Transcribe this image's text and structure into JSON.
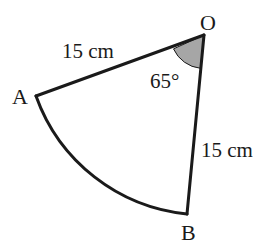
{
  "diagram": {
    "type": "circle-sector",
    "vertices": {
      "O": {
        "label": "O"
      },
      "A": {
        "label": "A"
      },
      "B": {
        "label": "B"
      }
    },
    "radius_OA_label": "15 cm",
    "radius_OB_label": "15 cm",
    "angle_label": "65°",
    "colors": {
      "stroke": "#1a1a1a",
      "angle_fill": "#a6a6a6",
      "background": "#ffffff"
    }
  }
}
